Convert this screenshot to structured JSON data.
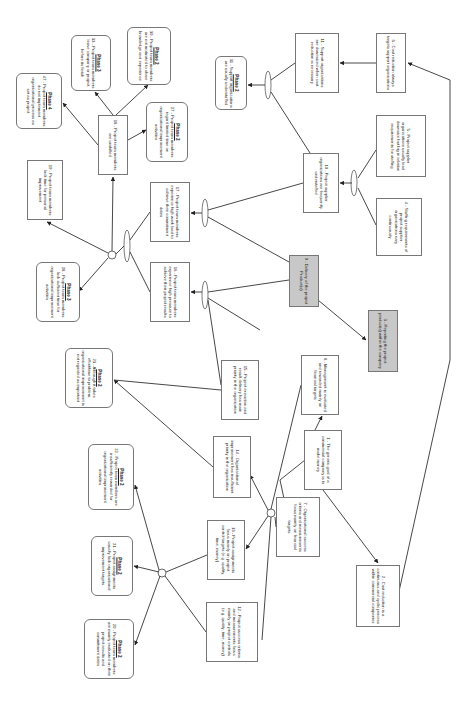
{
  "diagram": {
    "type": "current-reality-tree",
    "orientation": "rotated-90-clockwise",
    "nodes": [
      {
        "id": "1",
        "text": "1 - The generic goal of a commercial company is to make money",
        "x": 304,
        "y": 430,
        "w": 38,
        "h": 60,
        "style": "rect"
      },
      {
        "id": "2",
        "text": "2 - Cost reduction is a continuous and cyclic process within commercial companies",
        "x": 356,
        "y": 565,
        "w": 44,
        "h": 62,
        "style": "rect"
      },
      {
        "id": "3",
        "text": "3 - Reporting the project product(s) within the company",
        "x": 368,
        "y": 310,
        "w": 30,
        "h": 62,
        "style": "grey"
      },
      {
        "id": "4",
        "text": "4 - Staffing requirements of project supplier organizations vary continuously",
        "x": 376,
        "y": 198,
        "w": 46,
        "h": 58,
        "style": "rect"
      },
      {
        "id": "5",
        "text": "5 - Project supplier organizations usually lead downsize but big in relation requirements for staffing",
        "x": 376,
        "y": 115,
        "w": 50,
        "h": 62,
        "style": "rect"
      },
      {
        "id": "6",
        "text": "6 - Cost reduction always targets support organizations",
        "x": 376,
        "y": 33,
        "w": 30,
        "h": 60,
        "style": "rect"
      },
      {
        "id": "7",
        "text": "7 - Organizational success criteria and measurements focus mainly on financial targets",
        "x": 276,
        "y": 497,
        "w": 44,
        "h": 60,
        "style": "rect"
      },
      {
        "id": "8",
        "text": "8 - Management is evaluated and rewarded mainly on financial targets",
        "x": 301,
        "y": 355,
        "w": 38,
        "h": 60,
        "style": "rect"
      },
      {
        "id": "9",
        "text": "9 - Delivery of the project Product(s)",
        "x": 289,
        "y": 255,
        "w": 30,
        "h": 52,
        "style": "grey"
      },
      {
        "id": "10",
        "text": "10 - Project supplier organizations are frequently understaffed",
        "x": 303,
        "y": 153,
        "w": 36,
        "h": 60,
        "style": "rect"
      },
      {
        "id": "11",
        "text": "11 - Support organizations are downsized when cost reduction is necessary",
        "x": 295,
        "y": 33,
        "w": 44,
        "h": 60,
        "style": "rect"
      },
      {
        "id": "12",
        "text": "12 - Project success criteria and measurements focus mainly on project controls (e.g. quality, time, money)",
        "x": 206,
        "y": 602,
        "w": 52,
        "h": 60,
        "style": "rect"
      },
      {
        "id": "13",
        "text": "13 - Project assignments focus mainly on project control targets (e.g. quality, time, money)",
        "x": 207,
        "y": 520,
        "w": 38,
        "h": 60,
        "style": "rect"
      },
      {
        "id": "14",
        "text": "14 - Organizational improvement has insufficient priority in the organization",
        "x": 213,
        "y": 436,
        "w": 38,
        "h": 62,
        "style": "rect"
      },
      {
        "id": "15",
        "text": "15 - Project execution and result delivery has main priority in the organization",
        "x": 221,
        "y": 360,
        "w": 38,
        "h": 60,
        "style": "rect"
      },
      {
        "id": "16",
        "text": "16 - Project team members experience high pressure to achieve their project results",
        "x": 150,
        "y": 262,
        "w": 40,
        "h": 60,
        "style": "rect"
      },
      {
        "id": "17",
        "text": "17 - Project team members experience high work load to achieve their commitment dates",
        "x": 150,
        "y": 182,
        "w": 40,
        "h": 60,
        "style": "rect"
      },
      {
        "id": "18",
        "text": "18 - Project team members are unskilled",
        "x": 98,
        "y": 115,
        "w": 30,
        "h": 60,
        "style": "rect"
      },
      {
        "id": "19",
        "text": "19 - Project team members lack time for personal improvement",
        "x": 27,
        "y": 160,
        "w": 36,
        "h": 60,
        "style": "rect"
      },
      {
        "id": "20",
        "text": "20 - Project team members are mainly evaluated on their project results and commitment dates",
        "x": 84,
        "y": 619,
        "w": 50,
        "h": 60,
        "style": "rounded",
        "phase": "Phase 2"
      },
      {
        "id": "21",
        "text": "21 - Project assignments usually lack organizational improvement targets",
        "x": 91,
        "y": 536,
        "w": 42,
        "h": 60,
        "style": "rounded",
        "phase": "Phase 2"
      },
      {
        "id": "22",
        "text": "22 - Project team members are insufficiently rewarded for organizational improvement activities",
        "x": 88,
        "y": 444,
        "w": 46,
        "h": 66,
        "style": "rounded",
        "phase": "Phase 2"
      },
      {
        "id": "23",
        "text": "23 - Although it takes effort/time to problem, organizational improvement is not regarded as important",
        "x": 65,
        "y": 348,
        "w": 48,
        "h": 60,
        "style": "rounded",
        "phase": "Phase 2"
      },
      {
        "id": "27",
        "text": "27 - Project team members regard limited time on organizational improvement activities",
        "x": 146,
        "y": 102,
        "w": 42,
        "h": 60,
        "style": "rounded",
        "phase": "Phase 2"
      },
      {
        "id": "28",
        "text": "28 - Project team members lack sufficient time for organizational improvement activities",
        "x": 36,
        "y": 262,
        "w": 44,
        "h": 60,
        "style": "rounded",
        "phase": "Phase 3"
      },
      {
        "id": "30",
        "text": "30 - Project team members are not motivated to share knowledge and experience",
        "x": 127,
        "y": 27,
        "w": 44,
        "h": 58,
        "style": "rounded",
        "phase": "Phase 2"
      },
      {
        "id": "31",
        "text": "31 - Support organizations are usually understaffed",
        "x": 215,
        "y": 56,
        "w": 32,
        "h": 54,
        "style": "rounded",
        "phase": "Phase 2"
      },
      {
        "id": "33",
        "text": "33 - Project team members leave company or project before its finish",
        "x": 71,
        "y": 35,
        "w": 40,
        "h": 56,
        "style": "rounded",
        "phase": "Phase 3"
      },
      {
        "id": "47",
        "text": "47 - Project team members do not implement organizational process as set as project",
        "x": 16,
        "y": 73,
        "w": 46,
        "h": 56,
        "style": "rounded",
        "phase": "Phase 4"
      }
    ],
    "edges": [
      {
        "from": "1",
        "to": "2"
      },
      {
        "from": "1",
        "to": "7"
      },
      {
        "from": "1",
        "to": "8"
      },
      {
        "from": "2",
        "to": "6"
      },
      {
        "from": "6",
        "to": "11"
      },
      {
        "from": "9",
        "to": "3"
      },
      {
        "from": "4+5",
        "to": "10",
        "type": "and"
      },
      {
        "from": "10+11",
        "to": "31",
        "type": "and"
      },
      {
        "from": "9+15",
        "to": "16",
        "type": "and"
      },
      {
        "from": "9+10",
        "to": "17",
        "type": "and"
      },
      {
        "from": "16+17",
        "to": "junction-top",
        "type": "and"
      },
      {
        "from": "junction-top",
        "to": "18"
      },
      {
        "from": "junction-top",
        "to": "19"
      },
      {
        "from": "junction-top",
        "to": "28"
      },
      {
        "from": "18",
        "to": "47"
      },
      {
        "from": "18",
        "to": "33"
      },
      {
        "from": "18",
        "to": "30"
      },
      {
        "from": "18",
        "to": "27"
      },
      {
        "from": "junction-mid",
        "to": "13"
      },
      {
        "from": "junction-mid",
        "to": "14"
      },
      {
        "from": "14",
        "to": "23"
      },
      {
        "from": "junction-low",
        "to": "20"
      },
      {
        "from": "junction-low",
        "to": "21"
      },
      {
        "from": "junction-low",
        "to": "22"
      },
      {
        "from": "7",
        "to": "12"
      },
      {
        "from": "8",
        "to": "15"
      }
    ]
  }
}
